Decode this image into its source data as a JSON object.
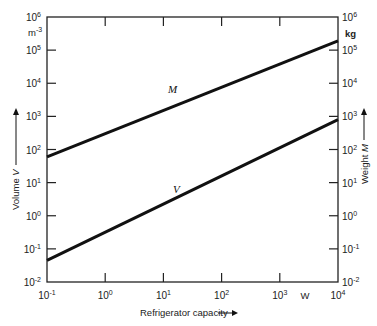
{
  "chart_data": {
    "type": "line",
    "title": "",
    "xlabel": "Refrigerator capacity",
    "xunit": "W",
    "ylabel_left": "Volume V",
    "yunit_left": "m-3",
    "ylabel_right": "Weight M",
    "yunit_right": "kg",
    "xscale": "log",
    "yscale": "log",
    "xlim": [
      0.1,
      10000
    ],
    "ylim": [
      0.01,
      1000000
    ],
    "x_ticks": [
      {
        "base": "10",
        "exp": "-1"
      },
      {
        "base": "10",
        "exp": "0"
      },
      {
        "base": "10",
        "exp": "1"
      },
      {
        "base": "10",
        "exp": "2"
      },
      {
        "base": "10",
        "exp": "3"
      },
      {
        "base": "10",
        "exp": "4"
      }
    ],
    "y_ticks": [
      {
        "base": "10",
        "exp": "-2"
      },
      {
        "base": "10",
        "exp": "-1"
      },
      {
        "base": "10",
        "exp": "0"
      },
      {
        "base": "10",
        "exp": "1"
      },
      {
        "base": "10",
        "exp": "2"
      },
      {
        "base": "10",
        "exp": "3"
      },
      {
        "base": "10",
        "exp": "4"
      },
      {
        "base": "10",
        "exp": "5"
      },
      {
        "base": "10",
        "exp": "6"
      }
    ],
    "grid": false,
    "legend": "inline labels",
    "series": [
      {
        "name": "M",
        "axis": "right",
        "x": [
          0.1,
          10000
        ],
        "y": [
          60,
          190000
        ]
      },
      {
        "name": "V",
        "axis": "left",
        "x": [
          0.1,
          10000
        ],
        "y": [
          0.045,
          800
        ]
      }
    ]
  }
}
